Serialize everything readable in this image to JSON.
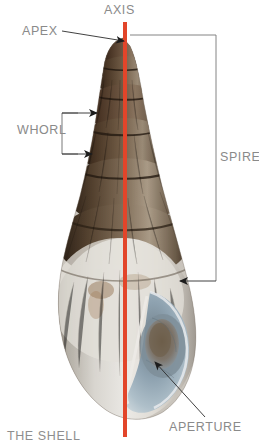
{
  "figure": {
    "caption": "THE SHELL",
    "background": "#ffffff",
    "axis_color": "#e2452a",
    "label_color": "#8a8a8a",
    "leader_color": "#3a3a3a"
  },
  "labels": {
    "axis": "AXIS",
    "apex": "APEX",
    "whorl": "WHORL",
    "spire": "SPIRE",
    "aperture": "APERTURE"
  },
  "annotations": [
    {
      "name": "axis",
      "text": "AXIS",
      "marker": "vertical-red-line",
      "x": 104,
      "y": 3
    },
    {
      "name": "apex",
      "text": "APEX",
      "marker": "arrow-right",
      "x": 22,
      "y": 24
    },
    {
      "name": "whorl",
      "text": "WHORL",
      "marker": "bracket-two-arrows",
      "x": 17,
      "y": 123
    },
    {
      "name": "spire",
      "text": "SPIRE",
      "marker": "bracket-range",
      "x": 220,
      "y": 150
    },
    {
      "name": "aperture",
      "text": "APERTURE",
      "marker": "arrow-diagonal",
      "x": 169,
      "y": 420
    }
  ],
  "shell": {
    "spire_color": "#4a392c",
    "body_color": "#d9d6d0",
    "aperture_color": "#8fa3b2",
    "outline_color": "#6e6257"
  }
}
